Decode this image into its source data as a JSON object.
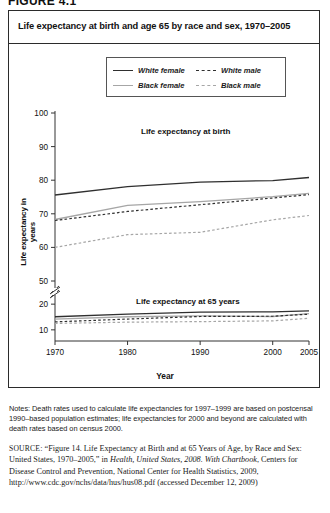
{
  "figure_number": "FIGURE 4.1",
  "panel": {
    "title": "Life expectancy at birth and age 65 by race and sex, 1970–2005"
  },
  "legend": {
    "items": [
      {
        "label": "White female",
        "style": "solid",
        "color": "#2f2f2f",
        "key": "white_female"
      },
      {
        "label": "White male",
        "style": "dashed",
        "color": "#2f2f2f",
        "key": "white_male"
      },
      {
        "label": "Black female",
        "style": "solid",
        "color": "#a6a6a6",
        "key": "black_female"
      },
      {
        "label": "Black male",
        "style": "dashed",
        "color": "#a6a6a6",
        "key": "black_male"
      }
    ]
  },
  "annotations": {
    "upper": "Life expectancy at birth",
    "lower": "Life expectancy at 65 years"
  },
  "axes": {
    "ylabel": "Life expectancy in years",
    "xlabel": "Year"
  },
  "notes": "Notes: Death rates used to calculate life expectancies for 1997–1999 are based on postcensal 1990–based population estimates; life expectancies for 2000 and beyond are calculated with death rates based on census 2000.",
  "source": {
    "tag": "SOURCE",
    "text_1": ": “Figure 14. Life Expectancy at Birth and at 65 Years of Age, by Race and Sex: United States, 1970–2005,” in ",
    "italic_1": "Health, United States, 2008. With Chartbook",
    "text_2": ", Centers for Disease Control and Prevention, National Center for Health Statistics, 2009, http://www.cdc.gov/nchs/data/hus/hus08.pdf (accessed December 12, 2009)"
  },
  "chart_data": {
    "type": "line",
    "title": "Life expectancy at birth and age 65 by race and sex, 1970–2005",
    "xlabel": "Year",
    "ylabel": "Life expectancy in years",
    "x": [
      1970,
      1980,
      1990,
      2000,
      2005
    ],
    "xlim": [
      1970,
      2005
    ],
    "xticks": [
      1970,
      1980,
      1990,
      2000,
      2005
    ],
    "yticks_upper": [
      50,
      60,
      70,
      80,
      90,
      100
    ],
    "yticks_lower": [
      10,
      20
    ],
    "ylim_upper": [
      50,
      100
    ],
    "ylim_lower": [
      8,
      22
    ],
    "broken_axis": true,
    "grid": false,
    "legend_position": "top-center",
    "groups": [
      {
        "name": "Life expectancy at birth",
        "series": [
          {
            "name": "White female",
            "style": "solid",
            "color": "#2f2f2f",
            "values": [
              75.6,
              78.1,
              79.4,
              79.9,
              80.8
            ]
          },
          {
            "name": "Black female",
            "style": "solid",
            "color": "#a6a6a6",
            "values": [
              68.3,
              72.5,
              73.6,
              75.1,
              76.1
            ]
          },
          {
            "name": "White male",
            "style": "dashed",
            "color": "#2f2f2f",
            "values": [
              68.0,
              70.7,
              72.7,
              74.7,
              75.7
            ]
          },
          {
            "name": "Black male",
            "style": "dashed",
            "color": "#a6a6a6",
            "values": [
              60.0,
              63.8,
              64.5,
              68.2,
              69.5
            ]
          }
        ]
      },
      {
        "name": "Life expectancy at 65 years",
        "series": [
          {
            "name": "White female",
            "style": "solid",
            "color": "#2f2f2f",
            "values": [
              15.1,
              16.1,
              16.9,
              17.0,
              17.4
            ]
          },
          {
            "name": "Black female",
            "style": "solid",
            "color": "#a6a6a6",
            "values": [
              14.2,
              15.1,
              15.4,
              15.2,
              16.3
            ]
          },
          {
            "name": "White male",
            "style": "dashed",
            "color": "#2f2f2f",
            "values": [
              13.1,
              14.2,
              15.2,
              15.3,
              16.1
            ]
          },
          {
            "name": "Black male",
            "style": "dashed",
            "color": "#a6a6a6",
            "values": [
              12.5,
              13.0,
              13.2,
              13.5,
              14.5
            ]
          }
        ]
      }
    ]
  }
}
